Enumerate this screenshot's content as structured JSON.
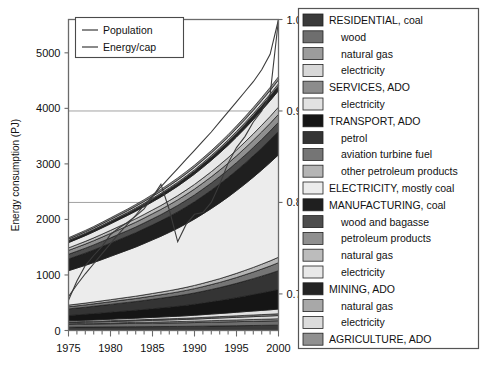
{
  "chart_data": {
    "type": "area",
    "title": "",
    "xlabel": "",
    "ylabel": "Energy consumption (PJ)",
    "y2label": "",
    "xlim": [
      1975,
      2000
    ],
    "ylim": [
      0,
      5600
    ],
    "y2lim": [
      0.66,
      1.0
    ],
    "grid": true,
    "legend_position": "right",
    "x": [
      1975,
      1976,
      1977,
      1978,
      1979,
      1980,
      1981,
      1982,
      1983,
      1984,
      1985,
      1986,
      1987,
      1988,
      1989,
      1990,
      1991,
      1992,
      1993,
      1994,
      1995,
      1996,
      1997,
      1998,
      1999,
      2000
    ],
    "xticks": [
      1975,
      1980,
      1985,
      1990,
      1995,
      2000
    ],
    "yticks": [
      0,
      1000,
      2000,
      3000,
      4000,
      5000
    ],
    "y2ticks": [
      0.7,
      0.8,
      0.9,
      1.0
    ],
    "stacked": true,
    "series": [
      {
        "name": "RESIDENTIAL, coal",
        "color": "#3a3a3a",
        "values": [
          60,
          61,
          62,
          63,
          64,
          65,
          66,
          67,
          68,
          69,
          70,
          71,
          72,
          73,
          74,
          76,
          78,
          80,
          82,
          84,
          86,
          88,
          90,
          92,
          94,
          96
        ]
      },
      {
        "name": "wood",
        "color": "#6e6e6e",
        "values": [
          52,
          53,
          54,
          55,
          56,
          57,
          58,
          59,
          60,
          61,
          62,
          63,
          64,
          65,
          66,
          67,
          68,
          70,
          71,
          72,
          73,
          75,
          76,
          77,
          78,
          80
        ]
      },
      {
        "name": "natural gas",
        "color": "#9c9c9c",
        "values": [
          10,
          11,
          12,
          13,
          14,
          15,
          16,
          17,
          18,
          19,
          20,
          21,
          22,
          23,
          24,
          25,
          26,
          27,
          28,
          29,
          30,
          31,
          32,
          33,
          34,
          35
        ]
      },
      {
        "name": "electricity",
        "color": "#d8d8d8",
        "values": [
          18,
          19,
          20,
          21,
          22,
          23,
          25,
          26,
          27,
          28,
          30,
          31,
          33,
          34,
          36,
          38,
          40,
          42,
          44,
          46,
          48,
          50,
          52,
          54,
          56,
          58
        ]
      },
      {
        "name": "SERVICES, ADO",
        "color": "#8c8c8c",
        "values": [
          14,
          15,
          15,
          16,
          16,
          17,
          17,
          18,
          18,
          19,
          19,
          20,
          20,
          21,
          21,
          22,
          23,
          24,
          25,
          26,
          27,
          28,
          29,
          30,
          31,
          32
        ]
      },
      {
        "name": "SERVICES electricity",
        "color": "#e2e2e2",
        "values": [
          20,
          21,
          22,
          23,
          25,
          26,
          28,
          29,
          31,
          33,
          35,
          37,
          39,
          41,
          44,
          47,
          50,
          53,
          56,
          60,
          64,
          68,
          72,
          76,
          80,
          85
        ]
      },
      {
        "name": "TRANSPORT, ADO",
        "color": "#151515",
        "values": [
          95,
          100,
          106,
          112,
          118,
          124,
          130,
          136,
          142,
          148,
          155,
          162,
          170,
          178,
          187,
          197,
          208,
          220,
          233,
          247,
          262,
          278,
          295,
          313,
          332,
          352
        ]
      },
      {
        "name": "petrol",
        "color": "#343434",
        "values": [
          120,
          124,
          128,
          133,
          138,
          143,
          148,
          153,
          158,
          164,
          170,
          176,
          182,
          189,
          196,
          204,
          213,
          223,
          234,
          246,
          259,
          273,
          288,
          304,
          321,
          339
        ]
      },
      {
        "name": "aviation turbine fuel",
        "color": "#757575",
        "values": [
          38,
          40,
          42,
          44,
          46,
          48,
          50,
          52,
          54,
          57,
          60,
          63,
          66,
          70,
          74,
          78,
          83,
          88,
          93,
          99,
          105,
          112,
          119,
          127,
          135,
          144
        ]
      },
      {
        "name": "other petroleum products",
        "color": "#b5b5b5",
        "values": [
          30,
          31,
          32,
          34,
          35,
          37,
          38,
          40,
          42,
          44,
          46,
          48,
          50,
          52,
          55,
          58,
          61,
          64,
          67,
          71,
          75,
          79,
          83,
          88,
          93,
          98
        ]
      },
      {
        "name": "ELECTRICITY, mostly coal",
        "color": "#ececec",
        "values": [
          620,
          650,
          680,
          710,
          745,
          780,
          815,
          850,
          885,
          925,
          965,
          1005,
          1050,
          1095,
          1145,
          1195,
          1250,
          1305,
          1365,
          1425,
          1490,
          1555,
          1625,
          1695,
          1770,
          1845
        ]
      },
      {
        "name": "MANUFACTURING, coal",
        "color": "#1f1f1f",
        "values": [
          210,
          215,
          220,
          226,
          232,
          238,
          244,
          250,
          257,
          264,
          271,
          278,
          286,
          294,
          302,
          311,
          320,
          330,
          340,
          350,
          361,
          372,
          384,
          396,
          408,
          421
        ]
      },
      {
        "name": "wood and bagasse",
        "color": "#4d4d4d",
        "values": [
          85,
          87,
          89,
          91,
          93,
          95,
          98,
          100,
          103,
          105,
          108,
          111,
          114,
          117,
          120,
          123,
          127,
          130,
          134,
          138,
          142,
          146,
          150,
          155,
          159,
          164
        ]
      },
      {
        "name": "petroleum products",
        "color": "#8f8f8f",
        "values": [
          70,
          72,
          74,
          76,
          78,
          80,
          82,
          84,
          87,
          89,
          92,
          94,
          97,
          100,
          103,
          106,
          109,
          112,
          116,
          119,
          123,
          127,
          131,
          135,
          139,
          143
        ]
      },
      {
        "name": "MANUFACTURING natural gas",
        "color": "#bcbcbc",
        "values": [
          45,
          47,
          49,
          51,
          53,
          55,
          58,
          60,
          63,
          65,
          68,
          71,
          74,
          77,
          81,
          84,
          88,
          92,
          96,
          100,
          105,
          110,
          115,
          120,
          125,
          131
        ]
      },
      {
        "name": "MANUFACTURING electricity",
        "color": "#e8e8e8",
        "values": [
          95,
          99,
          103,
          108,
          113,
          118,
          123,
          129,
          135,
          141,
          147,
          154,
          161,
          169,
          177,
          185,
          194,
          203,
          213,
          223,
          234,
          245,
          257,
          269,
          282,
          296
        ]
      },
      {
        "name": "MINING, ADO",
        "color": "#242424",
        "values": [
          30,
          31,
          32,
          33,
          35,
          36,
          38,
          39,
          41,
          43,
          45,
          47,
          49,
          51,
          53,
          56,
          58,
          61,
          64,
          67,
          70,
          74,
          77,
          81,
          85,
          89
        ]
      },
      {
        "name": "MINING natural gas",
        "color": "#a8a8a8",
        "values": [
          12,
          12,
          13,
          13,
          14,
          15,
          15,
          16,
          17,
          17,
          18,
          19,
          20,
          21,
          22,
          23,
          24,
          25,
          26,
          27,
          29,
          30,
          31,
          33,
          34,
          36
        ]
      },
      {
        "name": "MINING electricity",
        "color": "#dcdcdc",
        "values": [
          22,
          23,
          24,
          25,
          26,
          28,
          29,
          30,
          32,
          33,
          35,
          36,
          38,
          40,
          42,
          44,
          46,
          48,
          50,
          52,
          55,
          57,
          60,
          63,
          66,
          69
        ]
      },
      {
        "name": "AGRICULTURE, ADO",
        "color": "#909090",
        "values": [
          24,
          25,
          25,
          26,
          27,
          28,
          29,
          30,
          31,
          32,
          33,
          34,
          35,
          37,
          38,
          39,
          41,
          42,
          44,
          46,
          47,
          49,
          51,
          53,
          55,
          57
        ]
      }
    ],
    "overlay_lines": [
      {
        "name": "Population",
        "axis": "right",
        "color": "#3b3b3b",
        "values": [
          0.697,
          0.71,
          0.722,
          0.733,
          0.744,
          0.755,
          0.766,
          0.776,
          0.786,
          0.797,
          0.807,
          0.817,
          0.827,
          0.837,
          0.847,
          0.857,
          0.867,
          0.877,
          0.888,
          0.899,
          0.91,
          0.921,
          0.932,
          0.945,
          0.962,
          1.0
        ]
      },
      {
        "name": "Energy/cap",
        "axis": "right",
        "color": "#3b3b3b",
        "values": [
          0.693,
          0.714,
          0.731,
          0.742,
          0.752,
          0.765,
          0.772,
          0.778,
          0.785,
          0.793,
          0.806,
          0.82,
          0.792,
          0.757,
          0.776,
          0.787,
          0.789,
          0.8,
          0.82,
          0.843,
          0.86,
          0.872,
          0.888,
          0.9,
          0.918,
          1.0
        ]
      }
    ]
  },
  "inner_legend": {
    "items": [
      {
        "label": "Population"
      },
      {
        "label": "Energy/cap"
      }
    ]
  },
  "legend": {
    "items": [
      {
        "label": "RESIDENTIAL, coal",
        "color": "#3a3a3a",
        "indent": 0
      },
      {
        "label": "wood",
        "color": "#6e6e6e",
        "indent": 1
      },
      {
        "label": "natural gas",
        "color": "#9c9c9c",
        "indent": 1
      },
      {
        "label": "electricity",
        "color": "#d8d8d8",
        "indent": 1
      },
      {
        "label": "SERVICES, ADO",
        "color": "#8c8c8c",
        "indent": 0
      },
      {
        "label": "electricity",
        "color": "#e2e2e2",
        "indent": 1
      },
      {
        "label": "TRANSPORT, ADO",
        "color": "#151515",
        "indent": 0
      },
      {
        "label": "petrol",
        "color": "#343434",
        "indent": 1
      },
      {
        "label": "aviation turbine fuel",
        "color": "#757575",
        "indent": 1
      },
      {
        "label": "other petroleum products",
        "color": "#b5b5b5",
        "indent": 1
      },
      {
        "label": "ELECTRICITY, mostly coal",
        "color": "#ececec",
        "indent": 0
      },
      {
        "label": "MANUFACTURING, coal",
        "color": "#1f1f1f",
        "indent": 0
      },
      {
        "label": "wood and bagasse",
        "color": "#4d4d4d",
        "indent": 1
      },
      {
        "label": "petroleum products",
        "color": "#8f8f8f",
        "indent": 1
      },
      {
        "label": "natural gas",
        "color": "#bcbcbc",
        "indent": 1
      },
      {
        "label": "electricity",
        "color": "#e8e8e8",
        "indent": 1
      },
      {
        "label": "MINING, ADO",
        "color": "#242424",
        "indent": 0
      },
      {
        "label": "natural gas",
        "color": "#a8a8a8",
        "indent": 1
      },
      {
        "label": "electricity",
        "color": "#dcdcdc",
        "indent": 1
      },
      {
        "label": "AGRICULTURE, ADO",
        "color": "#909090",
        "indent": 0
      }
    ]
  }
}
